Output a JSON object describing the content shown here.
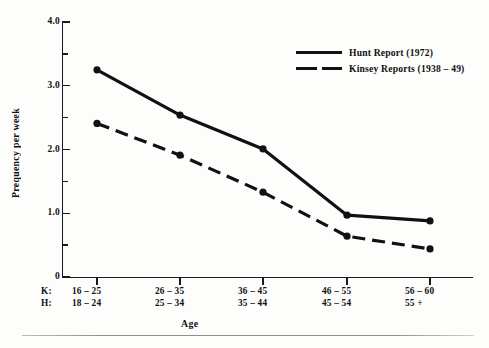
{
  "chart_data": {
    "type": "line",
    "title": "",
    "xlabel": "Age",
    "ylabel": "Prequency per week",
    "ylim": [
      0,
      4.0
    ],
    "y_major_ticks": [
      "0",
      "1.0",
      "2.0",
      "3.0",
      "4.0"
    ],
    "y_major_values": [
      0,
      1.0,
      2.0,
      3.0,
      4.0
    ],
    "y_minor_values": [
      0.5,
      1.5,
      2.5,
      3.5
    ],
    "grid": false,
    "legend_position": "top-right",
    "x_axis_rows": [
      {
        "key": "K:",
        "labels": [
          "16 – 25",
          "26 – 35",
          "36 – 45",
          "46 – 55",
          "56 – 60"
        ]
      },
      {
        "key": "H:",
        "labels": [
          "18 – 24",
          "25 – 34",
          "35 – 44",
          "45 – 54",
          "55 +"
        ]
      }
    ],
    "categories": [
      "16 – 25",
      "26 – 35",
      "36 – 45",
      "46 – 55",
      "56 – 60"
    ],
    "series": [
      {
        "name": "Hunt Report (1972)",
        "style": "solid",
        "color": "#111111",
        "values": [
          3.25,
          2.54,
          2.01,
          0.97,
          0.88
        ]
      },
      {
        "name": "Kinsey Reports (1938 – 49)",
        "style": "dashed",
        "color": "#111111",
        "values": [
          2.41,
          1.91,
          1.33,
          0.64,
          0.44
        ]
      }
    ]
  },
  "legend": {
    "items": [
      {
        "label": "Hunt Report (1972)",
        "style": "solid"
      },
      {
        "label": "Kinsey Reports (1938 – 49)",
        "style": "dashed"
      }
    ]
  },
  "axes": {
    "y_title": "Prequency per week",
    "x_title": "Age",
    "y_labels": [
      "4.0",
      "3.0",
      "2.0",
      "1.0",
      "0"
    ]
  }
}
